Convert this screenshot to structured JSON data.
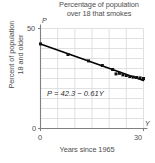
{
  "figure": {
    "title": "Percentage of population over 18 that smokes",
    "title_line1": "Percentage of population",
    "title_line2": "over 18 that smokes",
    "equation_label": "P = 42.3 − 0.61Y",
    "axis_variable_y": "P",
    "axis_variable_x": "Y",
    "ylabel_line1": "Percent of population",
    "ylabel_line2": "18 and older",
    "xlabel": "Years since 1965",
    "tick_y_top": "50",
    "tick_y_bottom": "0",
    "tick_x_left": "0",
    "tick_x_right": "30",
    "colors": {
      "line": "#000000",
      "marker": "#111111",
      "grid": "#d9d9d9",
      "axis": "#808080",
      "text": "#4f4f4f"
    }
  },
  "chart_data": {
    "type": "scatter",
    "title": "Percentage of population over 18 that smokes",
    "xlabel": "Years since 1965",
    "ylabel": "Percent of population 18 and older",
    "x_variable": "Y",
    "y_variable": "P",
    "xlim": [
      0,
      30
    ],
    "ylim": [
      0,
      50
    ],
    "xticks": [
      0,
      30
    ],
    "yticks": [
      0,
      50
    ],
    "grid": true,
    "grid_x_step": 5,
    "grid_y_step": 5,
    "legend": "none",
    "annotations": [
      {
        "text": "P = 42.3 − 0.61Y",
        "x": 5.5,
        "y": 15.5
      }
    ],
    "series": [
      {
        "name": "Regression line",
        "type": "line",
        "equation": "P = 42.3 - 0.61Y",
        "intercept": 42.3,
        "slope": -0.61,
        "x": [
          0,
          30
        ],
        "values": [
          42.3,
          24.0
        ]
      },
      {
        "name": "Observed percentage",
        "type": "scatter",
        "x": [
          0,
          8,
          14,
          18,
          21,
          22,
          23,
          24,
          25,
          26,
          27,
          28,
          29,
          30
        ],
        "values": [
          42.3,
          37.0,
          33.8,
          31.5,
          29.5,
          27.3,
          27.6,
          26.8,
          26.5,
          26.0,
          25.7,
          25.5,
          25.3,
          25.0
        ]
      }
    ]
  }
}
